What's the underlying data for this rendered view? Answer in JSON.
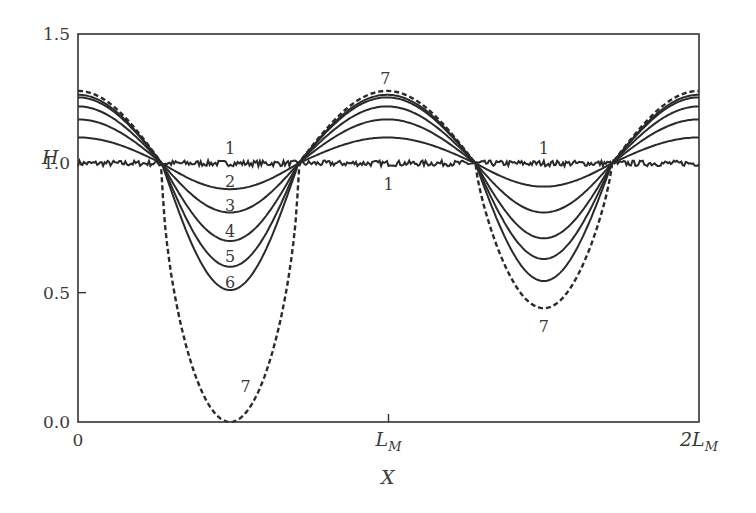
{
  "chart_data": {
    "type": "line",
    "title": "",
    "xlabel": "X",
    "ylabel": "H",
    "xlim": [
      0,
      2
    ],
    "ylim": [
      0.0,
      1.5
    ],
    "x_ticks": [
      {
        "value": 0,
        "label": "0"
      },
      {
        "value": 1,
        "label": "L",
        "sub": "M"
      },
      {
        "value": 2,
        "label": "2L",
        "sub": "M"
      }
    ],
    "y_ticks": [
      {
        "value": 0.0,
        "label": "0.0"
      },
      {
        "value": 0.5,
        "label": "0.5"
      },
      {
        "value": 1.0,
        "label": "1.0"
      },
      {
        "value": 1.5,
        "label": "1.5"
      }
    ],
    "x_unit": "L_M",
    "grid": false,
    "legend": "none (curves labelled inline 1–7)",
    "crossing_points_x": [
      0.27,
      0.71,
      1.28,
      1.72
    ],
    "series": [
      {
        "name": "1",
        "style": "solid-noisy",
        "peak_value": 1.0,
        "left_trough_min": 1.0,
        "right_trough_min": 1.0
      },
      {
        "name": "2",
        "style": "solid",
        "peak_value": 1.1,
        "left_trough_min": 0.9,
        "right_trough_min": 0.91
      },
      {
        "name": "3",
        "style": "solid",
        "peak_value": 1.17,
        "left_trough_min": 0.81,
        "right_trough_min": 0.81
      },
      {
        "name": "4",
        "style": "solid",
        "peak_value": 1.22,
        "left_trough_min": 0.7,
        "right_trough_min": 0.71
      },
      {
        "name": "5",
        "style": "solid",
        "peak_value": 1.255,
        "left_trough_min": 0.6,
        "right_trough_min": 0.63
      },
      {
        "name": "6",
        "style": "solid",
        "peak_value": 1.265,
        "left_trough_min": 0.51,
        "right_trough_min": 0.545
      },
      {
        "name": "7",
        "style": "dashed",
        "peak_value": 1.28,
        "left_trough_min": 0.0,
        "right_trough_min": 0.44
      }
    ],
    "annotations": [
      {
        "text": "1",
        "x": 0.49,
        "y": 1.06
      },
      {
        "text": "1",
        "x": 1.5,
        "y": 1.06
      },
      {
        "text": "1",
        "x": 1.0,
        "y": 0.92
      },
      {
        "text": "2",
        "x": 0.49,
        "y": 0.93
      },
      {
        "text": "3",
        "x": 0.49,
        "y": 0.84
      },
      {
        "text": "4",
        "x": 0.49,
        "y": 0.74
      },
      {
        "text": "5",
        "x": 0.49,
        "y": 0.64
      },
      {
        "text": "6",
        "x": 0.49,
        "y": 0.54
      },
      {
        "text": "7",
        "x": 0.99,
        "y": 1.33
      },
      {
        "text": "7",
        "x": 0.54,
        "y": 0.14
      },
      {
        "text": "7",
        "x": 1.5,
        "y": 0.37
      }
    ]
  }
}
